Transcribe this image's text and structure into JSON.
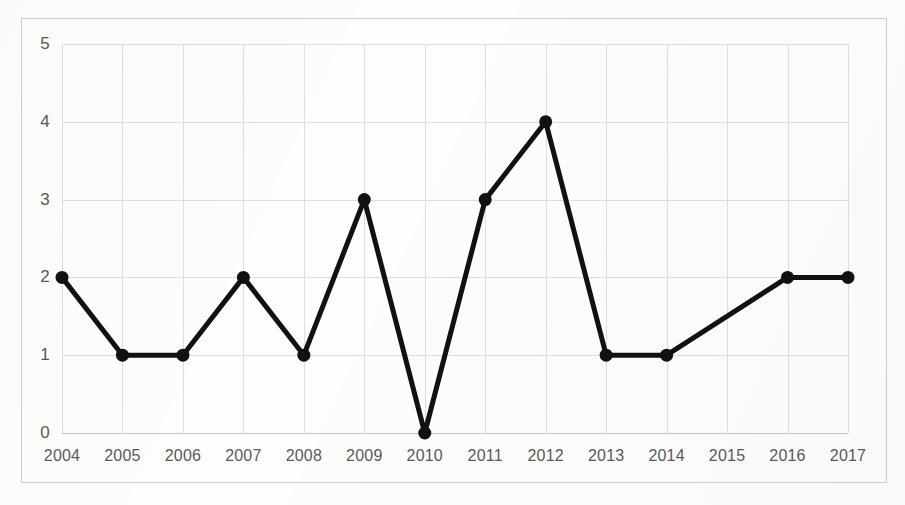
{
  "chart_data": {
    "type": "line",
    "title": "",
    "subtitle": "",
    "xlabel": "",
    "ylabel": "",
    "categories": [
      "2004",
      "2005",
      "2006",
      "2007",
      "2008",
      "2009",
      "2010",
      "2011",
      "2012",
      "2013",
      "2014",
      "2015",
      "2016",
      "2017"
    ],
    "values": [
      2,
      1,
      1,
      2,
      1,
      3,
      0,
      3,
      4,
      1,
      1,
      null,
      2,
      2
    ],
    "series": [
      {
        "name": "series-1",
        "values": [
          2,
          1,
          1,
          2,
          1,
          3,
          0,
          3,
          4,
          1,
          1,
          null,
          2,
          2
        ]
      }
    ],
    "points": [
      {
        "x": "2004",
        "y": 2,
        "marker": true
      },
      {
        "x": "2005",
        "y": 1,
        "marker": true
      },
      {
        "x": "2006",
        "y": 1,
        "marker": true
      },
      {
        "x": "2007",
        "y": 2,
        "marker": true
      },
      {
        "x": "2008",
        "y": 1,
        "marker": true
      },
      {
        "x": "2009",
        "y": 3,
        "marker": true
      },
      {
        "x": "2010",
        "y": 0,
        "marker": true
      },
      {
        "x": "2011",
        "y": 3,
        "marker": true
      },
      {
        "x": "2012",
        "y": 4,
        "marker": true
      },
      {
        "x": "2013",
        "y": 1,
        "marker": true
      },
      {
        "x": "2014",
        "y": 1,
        "marker": true
      },
      {
        "x": "2015",
        "y": null,
        "marker": false
      },
      {
        "x": "2016",
        "y": 2,
        "marker": true
      },
      {
        "x": "2017",
        "y": 2,
        "marker": true
      }
    ],
    "ylim": [
      0,
      5
    ],
    "yticks": [
      0,
      1,
      2,
      3,
      4,
      5
    ],
    "ytick_labels": [
      "0",
      "1",
      "2",
      "3",
      "4",
      "5"
    ],
    "xtick_labels": [
      "2004",
      "2005",
      "2006",
      "2007",
      "2008",
      "2009",
      "2010",
      "2011",
      "2012",
      "2013",
      "2014",
      "2015",
      "2016",
      "2017"
    ],
    "grid": true,
    "grid_axis": "both",
    "legend": false,
    "legend_position": "none",
    "annotations": [],
    "colors": {
      "line": "#111111",
      "marker": "#111111",
      "grid": "#dedede",
      "frame_border": "#cfcfcf",
      "tick_label": "#595959",
      "background": "#fdfdfc"
    },
    "style": {
      "line_width": 5,
      "marker_shape": "circle",
      "marker_size": 13
    }
  }
}
